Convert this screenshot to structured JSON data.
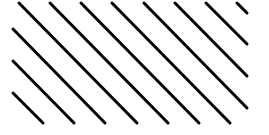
{
  "figure": {
    "width": 269,
    "height": 135,
    "background": "#ffffff",
    "stroke_color": "#000000",
    "stroke_width": 3,
    "lines": [
      {
        "x1": 19,
        "y1": 3,
        "x2": 137,
        "y2": 123
      },
      {
        "x1": 50,
        "y1": 3,
        "x2": 168,
        "y2": 123
      },
      {
        "x1": 81,
        "y1": 3,
        "x2": 199,
        "y2": 123
      },
      {
        "x1": 112,
        "y1": 3,
        "x2": 230,
        "y2": 123
      },
      {
        "x1": 144,
        "y1": 3,
        "x2": 247,
        "y2": 108
      },
      {
        "x1": 175,
        "y1": 3,
        "x2": 247,
        "y2": 76
      },
      {
        "x1": 206,
        "y1": 3,
        "x2": 247,
        "y2": 44
      },
      {
        "x1": 237,
        "y1": 3,
        "x2": 247,
        "y2": 13
      },
      {
        "x1": 13,
        "y1": 29,
        "x2": 105,
        "y2": 123
      },
      {
        "x1": 13,
        "y1": 61,
        "x2": 74,
        "y2": 123
      },
      {
        "x1": 13,
        "y1": 93,
        "x2": 43,
        "y2": 123
      }
    ]
  }
}
